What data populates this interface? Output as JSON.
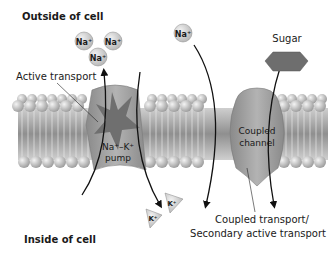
{
  "labels": {
    "outside": "Outside of cell",
    "inside": "Inside of cell",
    "active_transport": "Active transport",
    "pump_line1": "Na⁺–K⁺",
    "pump_line2": "pump",
    "channel_line1": "Coupled",
    "channel_line2": "channel",
    "coupled_line1": "Coupled transport/",
    "coupled_line2": "Secondary active transport",
    "sugar": "Sugar"
  },
  "ions": {
    "na_outside": [
      "Na⁺",
      "Na⁺",
      "Na⁺"
    ],
    "na_channel": "Na⁺",
    "k_inside": [
      "K⁺",
      "K⁺"
    ]
  },
  "colors": {
    "ion_fill": "#d9d9d9",
    "protein_fill": "#9c9c9c",
    "sugar_fill": "#6e6e6e",
    "lipid_head": "#c8c8c8",
    "arrow": "#111111"
  }
}
